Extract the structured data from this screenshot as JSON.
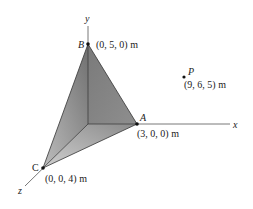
{
  "diagram": {
    "axes": {
      "x_label": "x",
      "y_label": "y",
      "z_label": "z"
    },
    "points": {
      "A": {
        "name": "A",
        "coord_label": "(3, 0, 0) m"
      },
      "B": {
        "name": "B",
        "coord_label": "(0, 5, 0) m"
      },
      "C": {
        "name": "C",
        "coord_label": "(0, 0, 4) m"
      },
      "P": {
        "name": "P",
        "coord_label": "(9, 6, 5) m"
      }
    },
    "colors": {
      "face_dark": "#7f7f7f",
      "face_light": "#b8b8b8",
      "edge": "#333333"
    }
  }
}
